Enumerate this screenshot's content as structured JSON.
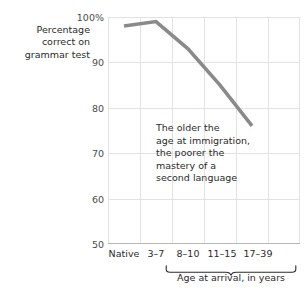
{
  "chart_data": {
    "type": "line",
    "title": "",
    "ylabel": "Percentage\ncorrect on\ngrammar test",
    "xlabel": "Age at arrival, in years",
    "categories": [
      "Native",
      "3–7",
      "8–10",
      "11–15",
      "17–39"
    ],
    "values": [
      98,
      99,
      93,
      85,
      76
    ],
    "series": [
      {
        "name": "Percentage correct on grammar test",
        "values": [
          98,
          99,
          93,
          85,
          76
        ]
      }
    ],
    "ylim": [
      50,
      100
    ],
    "yticks": [
      100,
      90,
      80,
      70,
      60,
      50
    ],
    "ytick_labels": [
      "100%",
      "90",
      "80",
      "70",
      "60",
      "50"
    ],
    "xlim_index": [
      0,
      5
    ],
    "grid": true,
    "legend": "none",
    "annotations": [
      {
        "text": "The older the\nage at immigration,\nthe poorer the\nmastery of a\nsecond language"
      }
    ],
    "brace": {
      "label": "Age at arrival, in years",
      "covers": [
        "3–7",
        "8–10",
        "11–15",
        "17–39"
      ]
    },
    "colors": {
      "line": "#8a8a8a",
      "grid": "#e2e2e2",
      "axis": "#bdbdbd",
      "text": "#2b2b2b",
      "tick_text": "#4a4a4a",
      "background": "#ffffff"
    }
  }
}
